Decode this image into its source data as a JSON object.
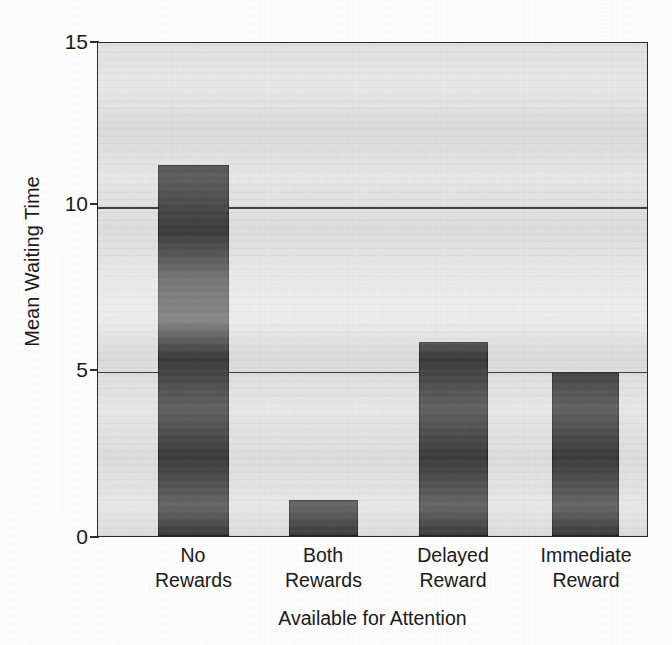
{
  "figure": {
    "background_color": "#ffffff",
    "plot_background_color": "#e3e3e3",
    "bar_color": "#3b3b3b",
    "axis_color": "#2a2a2a"
  },
  "chart_data": {
    "type": "bar",
    "title": "",
    "subtitle": "",
    "xlabel": "Available for Attention",
    "ylabel": "Mean Waiting Time",
    "categories": [
      "No Rewards",
      "Both Rewards",
      "Delayed Reward",
      "Immediate Reward"
    ],
    "category_lines": [
      [
        "No",
        "Rewards"
      ],
      [
        "Both",
        "Rewards"
      ],
      [
        "Delayed",
        "Reward"
      ],
      [
        "Immediate",
        "Reward"
      ]
    ],
    "values": [
      11.3,
      1.1,
      5.9,
      5.0
    ],
    "ylim": [
      0,
      15
    ],
    "yticks": [
      0,
      5,
      10,
      15
    ],
    "ytick_labels": [
      "0",
      "5",
      "10",
      "15"
    ],
    "grid": "horizontal",
    "gridlines_at": [
      5,
      10
    ],
    "legend": null,
    "legend_position": "none",
    "annotations": []
  },
  "axis": {
    "y_tick_0": "0",
    "y_tick_5": "5",
    "y_tick_10": "10",
    "y_tick_15": "15"
  },
  "categories": {
    "c0_line1": "No",
    "c0_line2": "Rewards",
    "c1_line1": "Both",
    "c1_line2": "Rewards",
    "c2_line1": "Delayed",
    "c2_line2": "Reward",
    "c3_line1": "Immediate",
    "c3_line2": "Reward"
  },
  "labels": {
    "x_axis_title": "Available for Attention",
    "y_axis_title": "Mean Waiting Time"
  }
}
